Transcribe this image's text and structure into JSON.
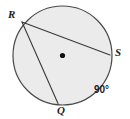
{
  "figure": {
    "kind": "circle-with-two-chords",
    "canvas": {
      "width": 130,
      "height": 119,
      "background": "#ffffff"
    },
    "circle": {
      "name": "circle-outline",
      "cx": 62.5,
      "cy": 55.5,
      "r": 49.5,
      "fill": "#ebebeb",
      "stroke": "#4a4a4a",
      "stroke_width": 1.2
    },
    "center_dot": {
      "name": "circle-center-dot",
      "cx": 62.5,
      "cy": 55.5,
      "r": 2.6,
      "fill": "#111111"
    },
    "points": [
      {
        "id": "R",
        "label": "R",
        "x": 22.0,
        "y": 22.0,
        "label_x": 8,
        "label_y": 9
      },
      {
        "id": "S",
        "label": "S",
        "x": 110.0,
        "y": 55.0,
        "label_x": 115,
        "label_y": 47
      },
      {
        "id": "Q",
        "label": "Q",
        "x": 58.0,
        "y": 103.5,
        "label_x": 57,
        "label_y": 105
      }
    ],
    "chords": [
      {
        "id": "RS",
        "from": "R",
        "to": "S",
        "x1": 22.0,
        "y1": 22.0,
        "x2": 110.0,
        "y2": 55.0,
        "stroke": "#3a3a3a",
        "stroke_width": 1.1
      },
      {
        "id": "RQ",
        "from": "R",
        "to": "Q",
        "x1": 22.0,
        "y1": 22.0,
        "x2": 58.0,
        "y2": 103.5,
        "stroke": "#3a3a3a",
        "stroke_width": 1.1
      }
    ],
    "annotations": [
      {
        "id": "arc-measure",
        "text": "90°",
        "x": 94,
        "y": 85
      }
    ]
  },
  "labels": {
    "point_r": "R",
    "point_s": "S",
    "point_q": "Q",
    "arc_angle": "90°"
  },
  "colors": {
    "circle_fill": "#ebebeb",
    "circle_stroke": "#4a4a4a",
    "chord_stroke": "#3a3a3a",
    "center_dot": "#111111",
    "text": "#1d1d1d",
    "background": "#ffffff"
  }
}
